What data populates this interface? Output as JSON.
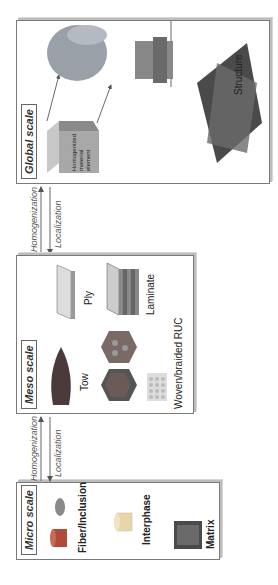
{
  "diagram": {
    "orientation": "rotated 90deg counter-clockwise",
    "scales": [
      {
        "id": "micro",
        "title": "Micro scale",
        "components": [
          "Fiber/Inclusion",
          "Interphase",
          "Matrix"
        ]
      },
      {
        "id": "meso",
        "title": "Meso scale",
        "components": [
          "Tow",
          "Ply",
          "Laminate",
          "Woven/braided RUC"
        ]
      },
      {
        "id": "global",
        "title": "Global scale",
        "element_label": "Homogenized material element",
        "structure_label": "Structure"
      }
    ],
    "transitions": [
      {
        "from": "micro",
        "to": "meso",
        "up_label": "Homogenization",
        "down_label": "Localization"
      },
      {
        "from": "meso",
        "to": "global",
        "up_label": "Homogenization",
        "down_label": "Localization"
      }
    ]
  }
}
